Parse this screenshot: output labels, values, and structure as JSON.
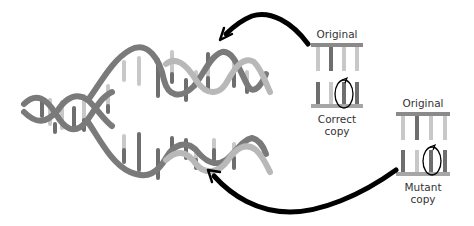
{
  "diagram": {
    "colors": {
      "strand_dark": "#7a7a7a",
      "strand_light": "#b8b8b8",
      "base_dark": "#6e6e6e",
      "base_light": "#c8c8c8",
      "arrow": "#000000",
      "circle": "#000000",
      "background": "#ffffff"
    },
    "panels": [
      {
        "id": "correct",
        "top_label": "Original",
        "bottom_label_line1": "Correct",
        "bottom_label_line2": "copy"
      },
      {
        "id": "mutant",
        "top_label": "Original",
        "bottom_label_line1": "Mutant",
        "bottom_label_line2": "copy"
      }
    ],
    "arrows": [
      {
        "from": "correct-copy-panel",
        "to": "upper-daughter-helix"
      },
      {
        "from": "mutant-copy-panel",
        "to": "lower-daughter-helix"
      }
    ]
  }
}
